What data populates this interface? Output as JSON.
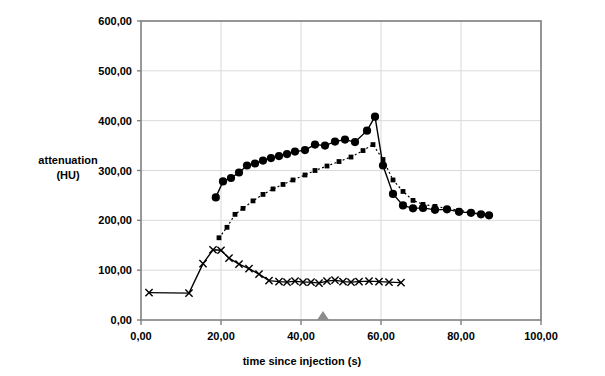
{
  "chart_data": {
    "type": "line",
    "title": "",
    "xlabel": "time since injection (s)",
    "ylabel": "attenuation (HU)",
    "ylabel_lines": [
      "attenuation",
      "(HU)"
    ],
    "xlim": [
      0,
      100
    ],
    "ylim": [
      0,
      600
    ],
    "xticks": [
      0,
      20,
      40,
      60,
      80,
      100
    ],
    "yticks": [
      0,
      100,
      200,
      300,
      400,
      500,
      600
    ],
    "xtick_labels": [
      "0,00",
      "20,00",
      "40,00",
      "60,00",
      "80,00",
      "100,00"
    ],
    "ytick_labels": [
      "0,00",
      "100,00",
      "200,00",
      "300,00",
      "400,00",
      "500,00",
      "600,00"
    ],
    "grid": true,
    "grid_color": "#d9d9d9",
    "frame_color": "#808080",
    "legend": "none",
    "series": [
      {
        "name": "aorta",
        "marker": "circle",
        "line_style": "solid",
        "color": "#000000",
        "x": [
          18.7,
          20.5,
          22.5,
          24.5,
          26.5,
          28.5,
          30.5,
          32.5,
          34.5,
          36.5,
          38.5,
          41.0,
          43.5,
          46.0,
          48.5,
          51.0,
          53.5,
          56.5,
          58.5,
          60.5,
          63.0,
          65.5,
          68.0,
          70.5,
          73.5,
          76.5,
          79.5,
          82.5,
          85.0,
          87.0
        ],
        "y": [
          246,
          278,
          285,
          296,
          310,
          314,
          320,
          325,
          329,
          333,
          338,
          341,
          352,
          350,
          358,
          362,
          357,
          380,
          408,
          310,
          253,
          230,
          224,
          225,
          221,
          222,
          217,
          215,
          212,
          210
        ]
      },
      {
        "name": "pulmonary",
        "marker": "square",
        "line_style": "dotted",
        "color": "#000000",
        "x": [
          19.5,
          21.5,
          23.5,
          25.5,
          28.0,
          30.5,
          33.0,
          35.5,
          38.0,
          41.0,
          43.5,
          46.5,
          49.5,
          52.5,
          55.5,
          58.0,
          60.5,
          63.0,
          65.5,
          68.0,
          70.5,
          73.5,
          76.5,
          79.5,
          82.5,
          85.0,
          87.0
        ],
        "y": [
          165,
          186,
          212,
          224,
          239,
          252,
          263,
          272,
          281,
          291,
          300,
          309,
          318,
          327,
          340,
          352,
          322,
          281,
          258,
          240,
          232,
          228,
          224,
          220,
          216,
          213,
          209
        ]
      },
      {
        "name": "vena cava",
        "marker": "x",
        "line_style": "solid",
        "color": "#000000",
        "x": [
          2.0,
          12.0,
          15.5,
          18.0,
          20.0,
          22.0,
          24.5,
          27.0,
          29.5,
          32.0,
          34.5,
          36.5,
          38.5,
          40.5,
          42.5,
          44.5,
          46.5,
          48.5,
          50.5,
          52.5,
          54.5,
          57.0,
          59.5,
          62.0,
          65.0
        ],
        "y": [
          55,
          54,
          113,
          141,
          140,
          124,
          112,
          103,
          92,
          79,
          77,
          76,
          78,
          76,
          76,
          74,
          78,
          80,
          77,
          76,
          77,
          78,
          77,
          76,
          75
        ]
      }
    ],
    "annotations": [
      {
        "name": "injection-end-marker",
        "shape": "triangle",
        "color": "#8c8c8c",
        "x": 45.5,
        "y": 0
      }
    ]
  }
}
